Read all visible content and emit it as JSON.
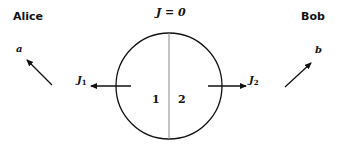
{
  "parties": {
    "left": "Alice",
    "right": "Bob"
  },
  "system": {
    "constraint_label": "J = 0",
    "region_1": "1",
    "region_2": "2",
    "current_1": {
      "symbol": "J",
      "subscript": "1"
    },
    "current_2": {
      "symbol": "J",
      "subscript": "2"
    }
  },
  "observables": {
    "left": "a",
    "right": "b"
  },
  "colors": {
    "stroke": "#111111",
    "divider": "#888888",
    "background": "#ffffff"
  }
}
